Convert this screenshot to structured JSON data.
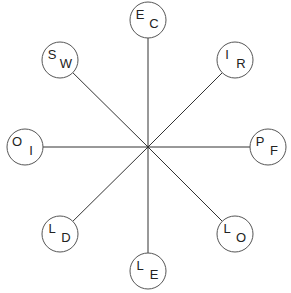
{
  "diagram": {
    "type": "radial-spoke-diagram",
    "center": {
      "x": 148,
      "y": 147
    },
    "node_radius": 18,
    "line_color": "#333333",
    "circle_color": "#555555",
    "text_color": "#222222",
    "nodes": [
      {
        "id": "top",
        "x": 148,
        "y": 20,
        "first": "E",
        "second": "C"
      },
      {
        "id": "top-right",
        "x": 235,
        "y": 60,
        "first": "I",
        "second": "R"
      },
      {
        "id": "right",
        "x": 268,
        "y": 147,
        "first": "P",
        "second": "F"
      },
      {
        "id": "bottom-right",
        "x": 235,
        "y": 234,
        "first": "L",
        "second": "O"
      },
      {
        "id": "bottom",
        "x": 148,
        "y": 271,
        "first": "L",
        "second": "E"
      },
      {
        "id": "bottom-left",
        "x": 60,
        "y": 234,
        "first": "L",
        "second": "D"
      },
      {
        "id": "left",
        "x": 25,
        "y": 147,
        "first": "O",
        "second": "I"
      },
      {
        "id": "top-left",
        "x": 60,
        "y": 60,
        "first": "S",
        "second": "W"
      }
    ]
  }
}
